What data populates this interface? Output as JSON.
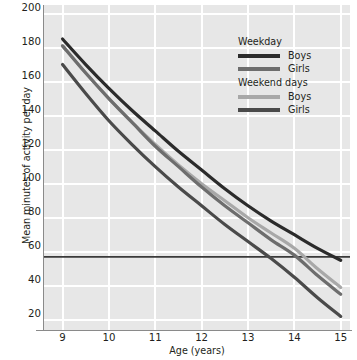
{
  "chart_data": {
    "type": "line",
    "title": "",
    "xlabel": "Age (years)",
    "ylabel": "Mean minutes of activity per day",
    "xlim": [
      8.6,
      15.2
    ],
    "ylim": [
      14,
      205
    ],
    "xticks": [
      9,
      10,
      11,
      12,
      13,
      14,
      15
    ],
    "yticks": [
      20,
      40,
      60,
      80,
      100,
      120,
      140,
      160,
      180,
      200
    ],
    "grid": true,
    "legend_position": "top-right",
    "x": [
      9,
      9.5,
      10,
      10.5,
      11,
      11.5,
      12,
      12.5,
      13,
      13.5,
      14,
      14.5,
      15
    ],
    "series": [
      {
        "name": "Weekday Boys",
        "group": "Weekday",
        "label": "Boys",
        "color": "#2b2b2b",
        "values": [
          185,
          170,
          156,
          143,
          131,
          119,
          108,
          97,
          87,
          78,
          70,
          62,
          55
        ]
      },
      {
        "name": "Weekday Girls",
        "group": "Weekday",
        "label": "Girls",
        "color": "#6d6d6d",
        "values": [
          181,
          165,
          150,
          136,
          122,
          110,
          98,
          87,
          77,
          67,
          58,
          46,
          35
        ]
      },
      {
        "name": "Weekend days Boys",
        "group": "Weekend days",
        "label": "Boys",
        "color": "#a8a8a8",
        "values": [
          181,
          165,
          150,
          136,
          123,
          111,
          100,
          90,
          80,
          71,
          62,
          50,
          39
        ]
      },
      {
        "name": "Weekend days Girls",
        "group": "Weekend days",
        "label": "Girls",
        "color": "#4a4a4a",
        "values": [
          170,
          153,
          137,
          123,
          110,
          98,
          87,
          76,
          66,
          56,
          45,
          33,
          22
        ]
      }
    ],
    "reference_line": {
      "name": "guideline-60-minutes",
      "orientation": "horizontal",
      "value": 57,
      "color": "#3a3a3a"
    },
    "annotations": []
  },
  "axes": {
    "y_title": "Mean minutes of activity per day",
    "x_title": "Age (years)",
    "y_tick_labels": [
      "200",
      "180",
      "160",
      "140",
      "120",
      "100",
      "80",
      "60",
      "40",
      "20"
    ],
    "x_tick_labels": [
      "9",
      "10",
      "11",
      "12",
      "13",
      "14",
      "15"
    ]
  },
  "legend": {
    "groups": [
      {
        "title": "Weekday",
        "items": [
          {
            "label": "Boys",
            "color": "#2b2b2b"
          },
          {
            "label": "Girls",
            "color": "#6d6d6d"
          }
        ]
      },
      {
        "title": "Weekend days",
        "items": [
          {
            "label": "Boys",
            "color": "#a8a8a8"
          },
          {
            "label": "Girls",
            "color": "#4a4a4a"
          }
        ]
      }
    ]
  },
  "style": {
    "plot_background": "#e7e7e7",
    "gridline_color": "#ffffff",
    "axis_color": "#8a8a8a",
    "text_color": "#231f20"
  }
}
